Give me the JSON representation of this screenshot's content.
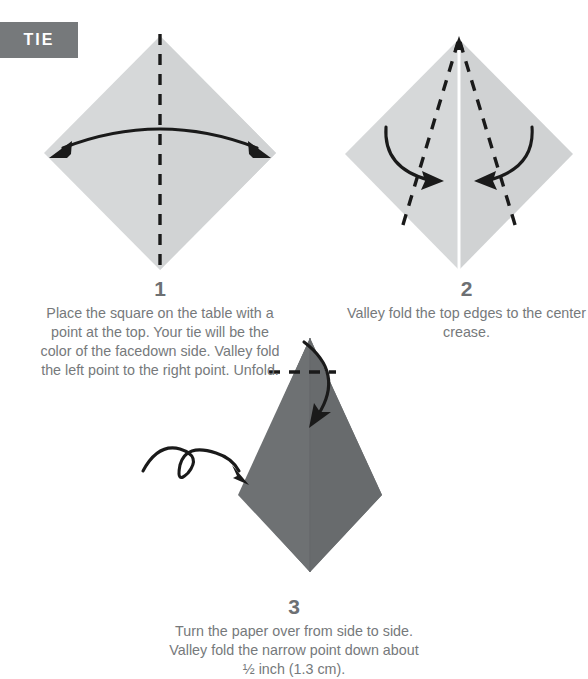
{
  "badge": {
    "label": "TIE",
    "background": "#76797b",
    "text_color": "#ffffff"
  },
  "colors": {
    "paper_light": "#d6d8d9",
    "paper_dark": "#6e7173",
    "paper_light_shade": "#cdcfd0",
    "paper_dark_shade": "#676a6c",
    "ink": "#1a1a1a",
    "crease_white": "#ffffff",
    "caption_text": "#76797b"
  },
  "steps": [
    {
      "number": "1",
      "text": "Place the square on the table with a point at the top. Your tie will be the color of the facedown side. Valley fold the left point to the right point. Unfold.",
      "diagram": {
        "shape": "square-diamond",
        "fold_line": "vertical-dashed-center",
        "arrow": "double-headed-arc-horizontal"
      }
    },
    {
      "number": "2",
      "text": "Valley fold the top edges to the center crease.",
      "diagram": {
        "shape": "square-diamond",
        "crease": "vertical-white-center",
        "fold_lines": "two-dashed-from-top-vertex",
        "arrows": "two-curved-inward"
      }
    },
    {
      "number": "3",
      "text": "Turn the paper over from side to side. Valley fold the narrow point down about ½ inch (1.3 cm).",
      "diagram": {
        "shape": "kite",
        "fold_line": "horizontal-dashed-near-top",
        "arrows": "curved-down-fold, turn-over-loop"
      }
    }
  ]
}
